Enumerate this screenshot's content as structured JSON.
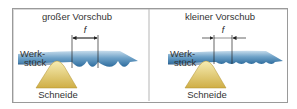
{
  "panels": [
    {
      "title": "großer Vorschub",
      "workpiece_label_1": "Werk-",
      "workpiece_label_2": "stück",
      "tool_label": "Schneide",
      "dimension_label": "f"
    },
    {
      "title": "kleiner Vorschub",
      "workpiece_label_1": "Werk-",
      "workpiece_label_2": "stück",
      "tool_label": "Schneide",
      "dimension_label": "f"
    }
  ],
  "colors": {
    "frame": "#9a9a9a",
    "workpiece_top": "#9ec3de",
    "workpiece_bottom": "#2f6d9e",
    "tool_light": "#f3e7a0",
    "tool_dark": "#c9a83a",
    "text": "#333333"
  }
}
